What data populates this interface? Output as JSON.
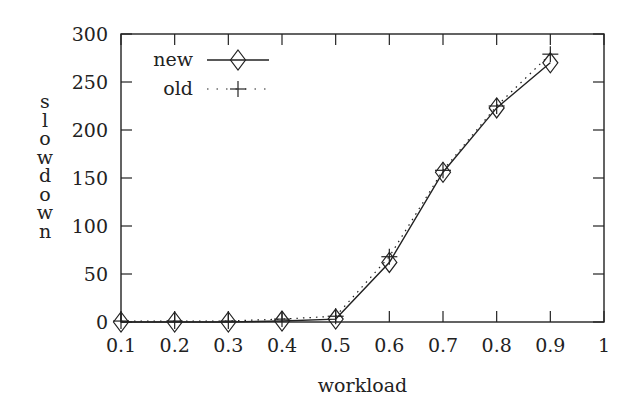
{
  "chart_data": {
    "type": "line",
    "title": "",
    "xlabel": "workload",
    "ylabel": "slowdown",
    "xlim": [
      0.1,
      1.0
    ],
    "ylim": [
      0,
      300
    ],
    "xticks": [
      0.1,
      0.2,
      0.3,
      0.4,
      0.5,
      0.6,
      0.7,
      0.8,
      0.9,
      1
    ],
    "xtick_labels": [
      "0.1",
      "0.2",
      "0.3",
      "0.4",
      "0.5",
      "0.6",
      "0.7",
      "0.8",
      "0.9",
      "1"
    ],
    "yticks": [
      0,
      50,
      100,
      150,
      200,
      250,
      300
    ],
    "ytick_labels": [
      "0",
      "50",
      "100",
      "150",
      "200",
      "250",
      "300"
    ],
    "grid": false,
    "legend_position": "top-left",
    "x": [
      0.1,
      0.2,
      0.3,
      0.4,
      0.5,
      0.6,
      0.7,
      0.8,
      0.9
    ],
    "series": [
      {
        "name": "new",
        "line_style": "solid",
        "marker": "diamond",
        "values": [
          0,
          0,
          0,
          1,
          3,
          62,
          156,
          223,
          270
        ]
      },
      {
        "name": "old",
        "line_style": "dotted",
        "marker": "plus",
        "values": [
          1,
          1,
          1,
          3,
          6,
          68,
          158,
          225,
          279
        ]
      }
    ]
  }
}
